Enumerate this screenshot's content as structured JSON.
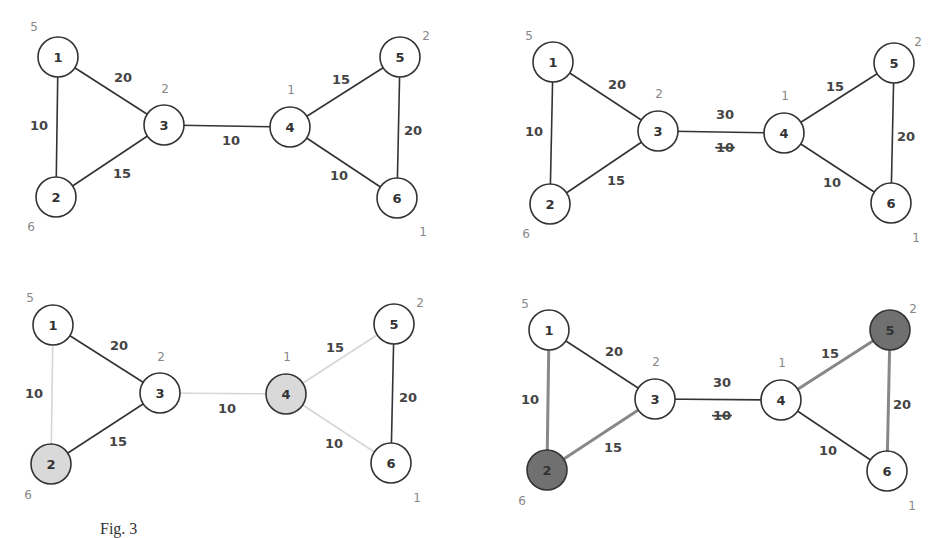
{
  "caption": "Fig. 3",
  "panels": [
    {
      "id": "top-left",
      "offset": [
        0,
        0
      ],
      "nodes": [
        {
          "id": "1",
          "x": 58,
          "y": 57,
          "side": "5",
          "sx": 34,
          "sy": 31,
          "fill": "#ffffff"
        },
        {
          "id": "2",
          "x": 56,
          "y": 197,
          "side": "6",
          "sx": 31,
          "sy": 231,
          "fill": "#ffffff"
        },
        {
          "id": "3",
          "x": 164,
          "y": 125,
          "side": "2",
          "sx": 165,
          "sy": 93,
          "fill": "#ffffff"
        },
        {
          "id": "4",
          "x": 290,
          "y": 127,
          "side": "1",
          "sx": 291,
          "sy": 94,
          "fill": "#ffffff"
        },
        {
          "id": "5",
          "x": 400,
          "y": 57,
          "side": "2",
          "sx": 426,
          "sy": 40,
          "fill": "#ffffff"
        },
        {
          "id": "6",
          "x": 397,
          "y": 198,
          "side": "1",
          "sx": 423,
          "sy": 236,
          "fill": "#ffffff"
        }
      ],
      "edges": [
        {
          "a": "1",
          "b": "3",
          "w": "20",
          "lx": 123,
          "ly": 82,
          "color": "#333"
        },
        {
          "a": "1",
          "b": "2",
          "w": "10",
          "lx": 39,
          "ly": 130,
          "color": "#333"
        },
        {
          "a": "2",
          "b": "3",
          "w": "15",
          "lx": 122,
          "ly": 178,
          "color": "#333"
        },
        {
          "a": "3",
          "b": "4",
          "w": "10",
          "lx": 231,
          "ly": 145,
          "color": "#333"
        },
        {
          "a": "4",
          "b": "5",
          "w": "15",
          "lx": 341,
          "ly": 84,
          "color": "#333"
        },
        {
          "a": "5",
          "b": "6",
          "w": "20",
          "lx": 413,
          "ly": 135,
          "color": "#333"
        },
        {
          "a": "4",
          "b": "6",
          "w": "10",
          "lx": 339,
          "ly": 180,
          "color": "#333"
        }
      ]
    },
    {
      "id": "top-right",
      "nodes": [
        {
          "id": "1",
          "x": 553,
          "y": 62,
          "side": "5",
          "sx": 529,
          "sy": 40,
          "fill": "#ffffff"
        },
        {
          "id": "2",
          "x": 550,
          "y": 204,
          "side": "6",
          "sx": 526,
          "sy": 238,
          "fill": "#ffffff"
        },
        {
          "id": "3",
          "x": 658,
          "y": 131,
          "side": "2",
          "sx": 659,
          "sy": 98,
          "fill": "#ffffff"
        },
        {
          "id": "4",
          "x": 784,
          "y": 133,
          "side": "1",
          "sx": 785,
          "sy": 100,
          "fill": "#ffffff"
        },
        {
          "id": "5",
          "x": 894,
          "y": 63,
          "side": "2",
          "sx": 918,
          "sy": 46,
          "fill": "#ffffff"
        },
        {
          "id": "6",
          "x": 891,
          "y": 203,
          "side": "1",
          "sx": 916,
          "sy": 242,
          "fill": "#ffffff"
        }
      ],
      "edges": [
        {
          "a": "1",
          "b": "3",
          "w": "20",
          "lx": 617,
          "ly": 89,
          "color": "#333"
        },
        {
          "a": "1",
          "b": "2",
          "w": "10",
          "lx": 534,
          "ly": 136,
          "color": "#333"
        },
        {
          "a": "2",
          "b": "3",
          "w": "15",
          "lx": 616,
          "ly": 185,
          "color": "#333"
        },
        {
          "a": "3",
          "b": "4",
          "w": "30",
          "struck": "10",
          "lx": 725,
          "ly": 119,
          "slx": 725,
          "sly": 152,
          "color": "#333"
        },
        {
          "a": "4",
          "b": "5",
          "w": "15",
          "lx": 835,
          "ly": 91,
          "color": "#333"
        },
        {
          "a": "5",
          "b": "6",
          "w": "20",
          "lx": 906,
          "ly": 141,
          "color": "#333"
        },
        {
          "a": "4",
          "b": "6",
          "w": "10",
          "lx": 832,
          "ly": 187,
          "color": "#333"
        }
      ]
    },
    {
      "id": "bottom-left",
      "nodes": [
        {
          "id": "1",
          "x": 53,
          "y": 325,
          "side": "5",
          "sx": 30,
          "sy": 302,
          "fill": "#ffffff"
        },
        {
          "id": "2",
          "x": 51,
          "y": 464,
          "side": "6",
          "sx": 28,
          "sy": 499,
          "fill": "#d9d9d9"
        },
        {
          "id": "3",
          "x": 160,
          "y": 393,
          "side": "2",
          "sx": 161,
          "sy": 361,
          "fill": "#ffffff"
        },
        {
          "id": "4",
          "x": 286,
          "y": 394,
          "side": "1",
          "sx": 287,
          "sy": 361,
          "fill": "#d9d9d9"
        },
        {
          "id": "5",
          "x": 394,
          "y": 324,
          "side": "2",
          "sx": 420,
          "sy": 307,
          "fill": "#ffffff"
        },
        {
          "id": "6",
          "x": 391,
          "y": 463,
          "side": "1",
          "sx": 417,
          "sy": 502,
          "fill": "#ffffff"
        }
      ],
      "edges": [
        {
          "a": "1",
          "b": "3",
          "w": "20",
          "lx": 119,
          "ly": 350,
          "color": "#333"
        },
        {
          "a": "1",
          "b": "2",
          "w": "10",
          "lx": 34,
          "ly": 398,
          "color": "#d6d6d6"
        },
        {
          "a": "2",
          "b": "3",
          "w": "15",
          "lx": 118,
          "ly": 446,
          "color": "#333"
        },
        {
          "a": "3",
          "b": "4",
          "w": "10",
          "lx": 227,
          "ly": 413,
          "color": "#d6d6d6"
        },
        {
          "a": "4",
          "b": "5",
          "w": "15",
          "lx": 335,
          "ly": 352,
          "color": "#d6d6d6"
        },
        {
          "a": "5",
          "b": "6",
          "w": "20",
          "lx": 408,
          "ly": 402,
          "color": "#333"
        },
        {
          "a": "4",
          "b": "6",
          "w": "10",
          "lx": 334,
          "ly": 448,
          "color": "#d6d6d6"
        }
      ]
    },
    {
      "id": "bottom-right",
      "nodes": [
        {
          "id": "1",
          "x": 549,
          "y": 330,
          "side": "5",
          "sx": 525,
          "sy": 308,
          "fill": "#ffffff"
        },
        {
          "id": "2",
          "x": 547,
          "y": 470,
          "side": "6",
          "sx": 522,
          "sy": 505,
          "fill": "#707070"
        },
        {
          "id": "3",
          "x": 655,
          "y": 399,
          "side": "2",
          "sx": 656,
          "sy": 366,
          "fill": "#ffffff"
        },
        {
          "id": "4",
          "x": 781,
          "y": 400,
          "side": "1",
          "sx": 782,
          "sy": 367,
          "fill": "#ffffff"
        },
        {
          "id": "5",
          "x": 890,
          "y": 330,
          "side": "2",
          "sx": 913,
          "sy": 313,
          "fill": "#707070"
        },
        {
          "id": "6",
          "x": 887,
          "y": 471,
          "side": "1",
          "sx": 912,
          "sy": 510,
          "fill": "#ffffff"
        }
      ],
      "edges": [
        {
          "a": "1",
          "b": "3",
          "w": "20",
          "lx": 614,
          "ly": 356,
          "color": "#333",
          "thick": false
        },
        {
          "a": "1",
          "b": "2",
          "w": "10",
          "lx": 530,
          "ly": 404,
          "color": "#888",
          "thick": true
        },
        {
          "a": "2",
          "b": "3",
          "w": "15",
          "lx": 613,
          "ly": 452,
          "color": "#888",
          "thick": true
        },
        {
          "a": "3",
          "b": "4",
          "w": "30",
          "struck": "10",
          "lx": 722,
          "ly": 387,
          "slx": 722,
          "sly": 420,
          "color": "#333",
          "thick": false
        },
        {
          "a": "4",
          "b": "5",
          "w": "15",
          "lx": 830,
          "ly": 358,
          "color": "#888",
          "thick": true
        },
        {
          "a": "5",
          "b": "6",
          "w": "20",
          "lx": 902,
          "ly": 409,
          "color": "#888",
          "thick": true
        },
        {
          "a": "4",
          "b": "6",
          "w": "10",
          "lx": 828,
          "ly": 455,
          "color": "#333",
          "thick": false
        }
      ]
    }
  ]
}
